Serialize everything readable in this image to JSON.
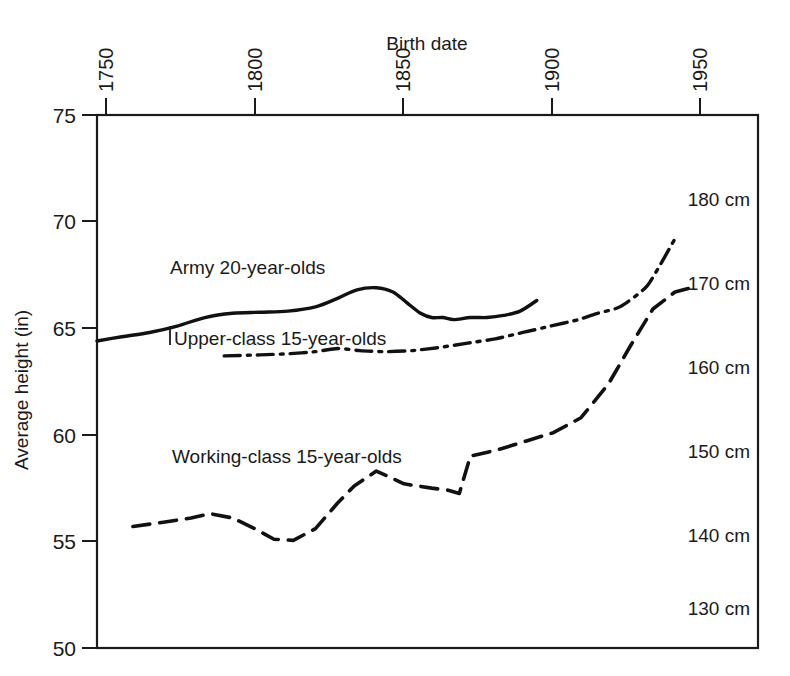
{
  "chart_data": {
    "type": "line",
    "title": "",
    "xlabel": "Birth date",
    "ylabel": "Average height (in)",
    "xlim": [
      1731,
      1970
    ],
    "ylim": [
      50,
      75
    ],
    "grid": false,
    "legend_position": "inline-labels",
    "x_ticks": [
      1750,
      1800,
      1850,
      1900,
      1950
    ],
    "x_tick_labels": [
      "1750",
      "1800",
      "1850",
      "1900",
      "1950"
    ],
    "y_ticks": [
      50,
      55,
      60,
      65,
      70,
      75
    ],
    "y_tick_labels": [
      "50",
      "55",
      "60",
      "65",
      "70",
      "75"
    ],
    "secondary_axis": {
      "unit": "cm",
      "labels": [
        "180 cm",
        "170 cm",
        "160 cm",
        "150 cm",
        "140 cm",
        "130 cm"
      ],
      "values_cm": [
        180,
        170,
        160,
        150,
        140,
        130
      ],
      "values_in": [
        70.87,
        66.93,
        62.99,
        59.06,
        55.12,
        51.18
      ],
      "position": "inside-right"
    },
    "series": [
      {
        "name": "Army  20-year-olds",
        "label": "Army  20-year-olds",
        "style": "solid",
        "x": [
          1731,
          1740,
          1750,
          1760,
          1770,
          1780,
          1790,
          1800,
          1810,
          1818,
          1825,
          1832,
          1838,
          1843,
          1848,
          1852,
          1856,
          1860,
          1866,
          1872,
          1878,
          1884,
          1890
        ],
        "y": [
          64.4,
          64.6,
          64.8,
          65.1,
          65.5,
          65.7,
          65.75,
          65.8,
          66.0,
          66.4,
          66.8,
          66.9,
          66.7,
          66.2,
          65.7,
          65.5,
          65.5,
          65.4,
          65.5,
          65.5,
          65.6,
          65.8,
          66.3
        ]
      },
      {
        "name": "Upper-class 15-year-olds",
        "label": "Upper-class 15-year-olds",
        "style": "dash-dot",
        "x": [
          1777,
          1790,
          1800,
          1810,
          1818,
          1826,
          1835,
          1845,
          1855,
          1865,
          1875,
          1885,
          1895,
          1905,
          1912,
          1920,
          1930,
          1940
        ],
        "y": [
          63.7,
          63.75,
          63.8,
          63.9,
          64.05,
          63.95,
          63.9,
          63.95,
          64.1,
          64.3,
          64.5,
          64.8,
          65.1,
          65.4,
          65.7,
          66.0,
          67.0,
          69.2
        ]
      },
      {
        "name": "Working-class 15-year-olds",
        "label": "Working-class 15-year-olds",
        "style": "dashed",
        "x": [
          1744,
          1755,
          1765,
          1772,
          1780,
          1788,
          1795,
          1802,
          1810,
          1818,
          1824,
          1832,
          1842,
          1852,
          1858,
          1862,
          1866,
          1876,
          1886,
          1896,
          1906,
          1916,
          1924,
          1932,
          1940,
          1946
        ],
        "y": [
          55.7,
          55.9,
          56.1,
          56.3,
          56.1,
          55.6,
          55.1,
          55.05,
          55.6,
          56.8,
          57.6,
          58.3,
          57.7,
          57.5,
          57.4,
          57.25,
          59.0,
          59.3,
          59.7,
          60.1,
          60.8,
          62.4,
          64.2,
          65.9,
          66.7,
          66.9
        ]
      }
    ],
    "inline_labels": [
      {
        "text": "Army  20-year-olds",
        "x_px": 170,
        "y_px": 267
      },
      {
        "text": "Upper-class 15-year-olds",
        "x_px": 172,
        "y_px": 334
      },
      {
        "text": "Working-class 15-year-olds",
        "x_px": 172,
        "y_px": 452
      }
    ]
  },
  "colors": {
    "axis": "#1a1a1a",
    "curve": "#111111",
    "background": "#ffffff"
  }
}
